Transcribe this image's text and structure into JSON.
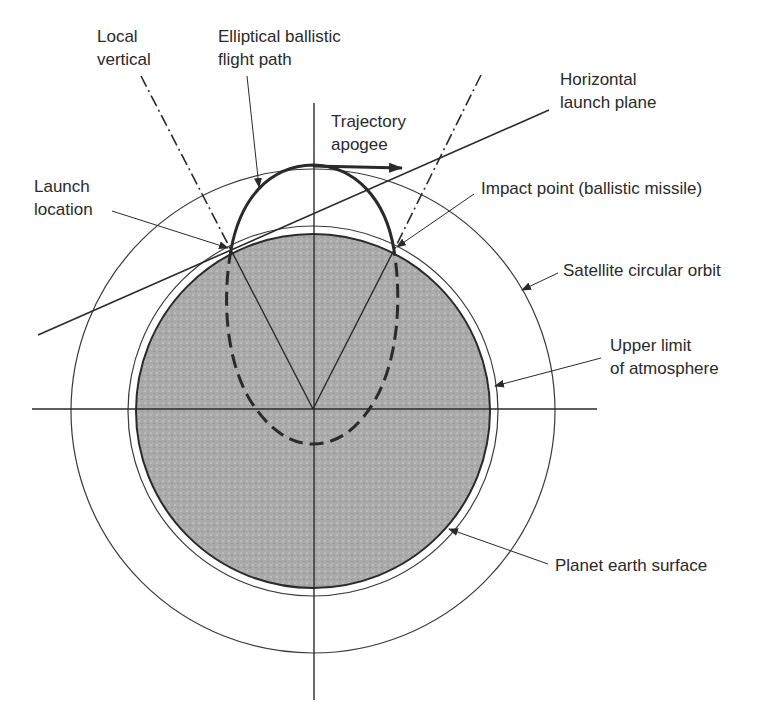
{
  "labels": {
    "local_vertical": [
      "Local",
      "vertical"
    ],
    "elliptical_path": [
      "Elliptical ballistic",
      "flight path"
    ],
    "horizontal_plane": [
      "Horizontal",
      "launch plane"
    ],
    "trajectory_apogee": [
      "Trajectory",
      "apogee"
    ],
    "launch_location": [
      "Launch",
      "location"
    ],
    "impact_point": "Impact point (ballistic missile)",
    "satellite_orbit": "Satellite circular orbit",
    "upper_atmosphere": [
      "Upper limit",
      "of atmosphere"
    ],
    "earth_surface": "Planet earth surface"
  },
  "colors": {
    "line": "#2a2a2a",
    "earth_fill": "#a9a9a9",
    "background": "#ffffff"
  }
}
